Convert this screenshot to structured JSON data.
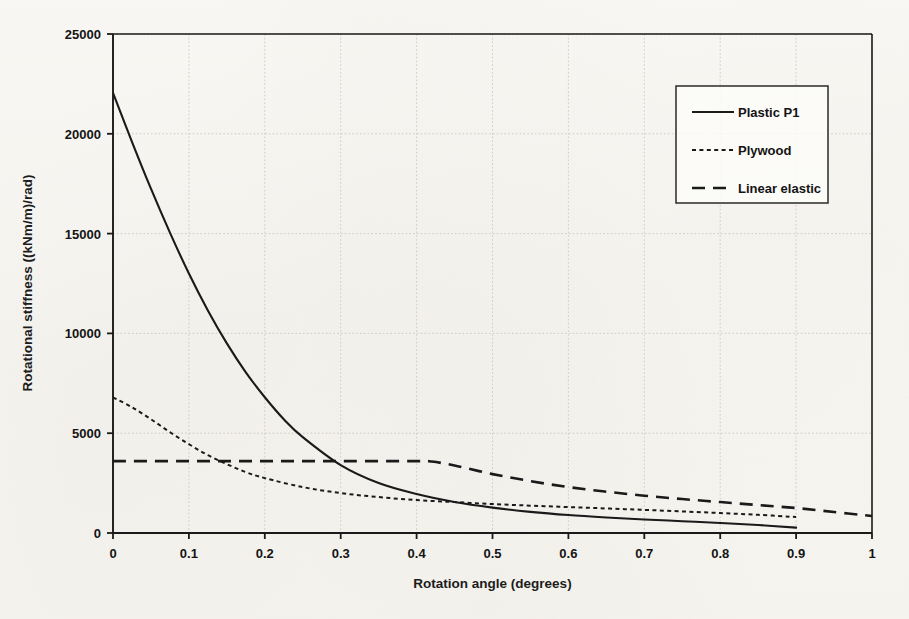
{
  "chart_data": {
    "type": "line",
    "title": "",
    "xlabel": "Rotation angle (degrees)",
    "ylabel": "Rotational stiffness ((kNm/m)/rad)",
    "xlim": [
      0,
      1
    ],
    "ylim": [
      0,
      25000
    ],
    "xticks": [
      "0",
      "0.1",
      "0.2",
      "0.3",
      "0.4",
      "0.5",
      "0.6",
      "0.7",
      "0.8",
      "0.9",
      "1"
    ],
    "xtick_values": [
      0,
      0.1,
      0.2,
      0.3,
      0.4,
      0.5,
      0.6,
      0.7,
      0.8,
      0.9,
      1
    ],
    "yticks": [
      "0",
      "5000",
      "10000",
      "15000",
      "20000",
      "25000"
    ],
    "ytick_values": [
      0,
      5000,
      10000,
      15000,
      20000,
      25000
    ],
    "grid": true,
    "grid_style": "light dotted major gridlines on both axes",
    "legend_position": "upper right, inside plot area, boxed",
    "series": [
      {
        "name": "Plastic P1",
        "style": "solid",
        "color": "#1a1a1a",
        "x": [
          0,
          0.025,
          0.05,
          0.075,
          0.1,
          0.125,
          0.15,
          0.175,
          0.2,
          0.225,
          0.25,
          0.3,
          0.35,
          0.4,
          0.45,
          0.5,
          0.55,
          0.6,
          0.65,
          0.7,
          0.75,
          0.8,
          0.85,
          0.9
        ],
        "y": [
          22050,
          19600,
          17250,
          15050,
          13000,
          11150,
          9500,
          8050,
          6800,
          5700,
          4800,
          3400,
          2500,
          1950,
          1550,
          1270,
          1060,
          900,
          780,
          680,
          590,
          500,
          400,
          270
        ]
      },
      {
        "name": "Plywood",
        "style": "dotted",
        "color": "#1a1a1a",
        "x": [
          0,
          0.025,
          0.05,
          0.075,
          0.1,
          0.125,
          0.15,
          0.175,
          0.2,
          0.25,
          0.3,
          0.35,
          0.4,
          0.45,
          0.5,
          0.55,
          0.6,
          0.65,
          0.7,
          0.75,
          0.8,
          0.85,
          0.9
        ],
        "y": [
          6800,
          6300,
          5700,
          5050,
          4450,
          3900,
          3450,
          3050,
          2750,
          2300,
          2000,
          1800,
          1650,
          1550,
          1450,
          1370,
          1300,
          1230,
          1160,
          1080,
          1000,
          910,
          800
        ]
      },
      {
        "name": "Linear elastic",
        "style": "dashed",
        "color": "#1a1a1a",
        "x": [
          0,
          0.1,
          0.2,
          0.3,
          0.4,
          0.42,
          0.45,
          0.5,
          0.55,
          0.6,
          0.65,
          0.7,
          0.75,
          0.8,
          0.85,
          0.9,
          0.95,
          1
        ],
        "y": [
          3600,
          3600,
          3600,
          3600,
          3600,
          3580,
          3380,
          2950,
          2600,
          2300,
          2070,
          1870,
          1700,
          1550,
          1400,
          1250,
          1050,
          850
        ]
      }
    ],
    "annotations": []
  },
  "legend": {
    "entries": [
      {
        "label": "Plastic P1",
        "style": "solid"
      },
      {
        "label": "Plywood",
        "style": "dotted"
      },
      {
        "label": "Linear elastic",
        "style": "dashed"
      }
    ]
  }
}
